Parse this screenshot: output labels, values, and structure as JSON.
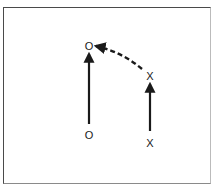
{
  "diagram": {
    "type": "play-diagram",
    "frame": {
      "border_color": "#4a4a4a",
      "background": "#ffffff"
    },
    "players": [
      {
        "id": "o-start",
        "symbol": "O",
        "x": 89,
        "y": 135
      },
      {
        "id": "o-end",
        "symbol": "O",
        "x": 89,
        "y": 46
      },
      {
        "id": "x-start",
        "symbol": "X",
        "x": 150,
        "y": 143
      },
      {
        "id": "x-end",
        "symbol": "X",
        "x": 150,
        "y": 76
      }
    ],
    "paths": [
      {
        "id": "o-run",
        "style": "solid",
        "from": "o-start",
        "to": "o-end",
        "arrowhead": true
      },
      {
        "id": "x-run",
        "style": "solid",
        "from": "x-start",
        "to": "x-end",
        "arrowhead": true
      },
      {
        "id": "x-pass",
        "style": "dashed",
        "from": "x-end",
        "to": "o-end",
        "arrowhead": true,
        "curved": true
      }
    ],
    "stroke_color": "#1a1a1a"
  }
}
